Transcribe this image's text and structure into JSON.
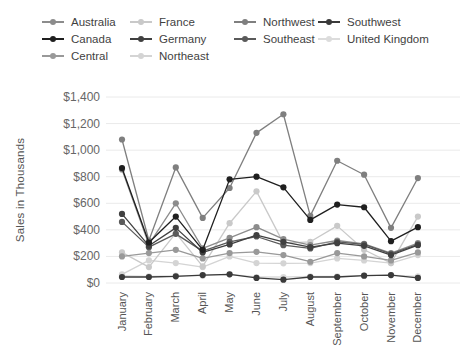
{
  "chart_data": {
    "type": "line",
    "title": "",
    "xlabel": "",
    "ylabel": "Sales in Thousands",
    "ylim": [
      0,
      1400
    ],
    "ytick_step": 200,
    "yticks": [
      "$0",
      "$200",
      "$400",
      "$600",
      "$800",
      "$1,000",
      "$1,200",
      "$1,400"
    ],
    "grid": "horizontal gridlines on",
    "legend_position": "top-left",
    "x_tick_rotation": -90,
    "categories": [
      "January",
      "February",
      "March",
      "April",
      "May",
      "June",
      "July",
      "August",
      "September",
      "October",
      "November",
      "December"
    ],
    "series": [
      {
        "name": "Australia",
        "color": "#8c8c8c",
        "values": [
          855,
          290,
          600,
          260,
          340,
          420,
          330,
          285,
          320,
          295,
          225,
          300
        ]
      },
      {
        "name": "France",
        "color": "#c9c9c9",
        "values": [
          230,
          120,
          375,
          125,
          450,
          690,
          300,
          310,
          430,
          250,
          150,
          500
        ]
      },
      {
        "name": "Northwest",
        "color": "#7f7f7f",
        "values": [
          1080,
          320,
          870,
          490,
          715,
          1130,
          1270,
          505,
          920,
          815,
          415,
          790
        ]
      },
      {
        "name": "Southwest",
        "color": "#3a3a3a",
        "values": [
          45,
          45,
          50,
          60,
          65,
          38,
          25,
          45,
          45,
          55,
          60,
          38
        ]
      },
      {
        "name": "Canada",
        "color": "#1f1f1f",
        "values": [
          865,
          305,
          500,
          250,
          780,
          800,
          720,
          475,
          590,
          570,
          315,
          420
        ]
      },
      {
        "name": "Germany",
        "color": "#404040",
        "values": [
          520,
          280,
          415,
          230,
          290,
          360,
          310,
          270,
          300,
          280,
          210,
          285
        ]
      },
      {
        "name": "Southeast",
        "color": "#5a5a5a",
        "values": [
          460,
          270,
          370,
          240,
          310,
          350,
          285,
          260,
          310,
          290,
          220,
          290
        ]
      },
      {
        "name": "United Kingdom",
        "color": "#dcdcdc",
        "values": [
          55,
          50,
          55,
          55,
          65,
          45,
          45,
          50,
          50,
          55,
          60,
          50
        ]
      },
      {
        "name": "Central",
        "color": "#999999",
        "values": [
          200,
          225,
          250,
          185,
          225,
          235,
          210,
          160,
          225,
          200,
          170,
          230
        ]
      },
      {
        "name": "Northeast",
        "color": "#d4d4d4",
        "values": [
          65,
          170,
          150,
          120,
          200,
          150,
          148,
          150,
          185,
          170,
          150,
          210
        ]
      }
    ]
  }
}
